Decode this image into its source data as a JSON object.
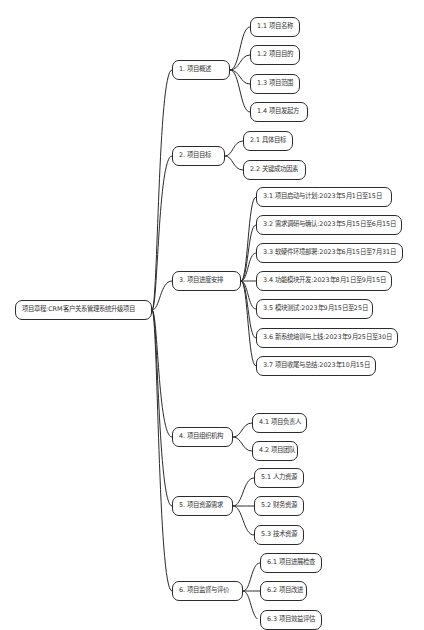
{
  "root": {
    "label": "项目章程:CRM客户关系管理系统升级项目"
  },
  "branches": [
    {
      "label": "1. 项目概述",
      "children": [
        {
          "label": "1.1 项目名称"
        },
        {
          "label": "1.2 项目目的"
        },
        {
          "label": "1.3 项目范围"
        },
        {
          "label": "1.4 项目发起方"
        }
      ]
    },
    {
      "label": "2. 项目目标",
      "children": [
        {
          "label": "2.1 具体目标"
        },
        {
          "label": "2.2 关键成功因素"
        }
      ]
    },
    {
      "label": "3. 项目进度安排",
      "children": [
        {
          "label": "3.1 项目启动与计划:2023年5月1日至15日"
        },
        {
          "label": "3.2 需求调研与确认:2023年5月15日至6月15日"
        },
        {
          "label": "3.3 软硬件环境部署:2023年6月15日至7月31日"
        },
        {
          "label": "3.4 功能模块开发:2023年8月1日至9月15日"
        },
        {
          "label": "3.5 模块测试:2023年9月15日至25日"
        },
        {
          "label": "3.6 新系统培训与上线:2023年9月25日至30日"
        },
        {
          "label": "3.7 项目收尾与总结:2023年10月15日"
        }
      ]
    },
    {
      "label": "4. 项目组织机构",
      "children": [
        {
          "label": "4.1 项目负责人"
        },
        {
          "label": "4.2 项目团队"
        }
      ]
    },
    {
      "label": "5. 项目资源需求",
      "children": [
        {
          "label": "5.1 人力资源"
        },
        {
          "label": "5.2 财务资源"
        },
        {
          "label": "5.3 技术资源"
        }
      ]
    },
    {
      "label": "6. 项目监督与评价",
      "children": [
        {
          "label": "6.1 项目进展检查"
        },
        {
          "label": "6.2 项目改进"
        },
        {
          "label": "6.3 项目效益评估"
        }
      ]
    }
  ],
  "colors": {
    "line": "#2b2b2b",
    "node_border": "#2b2b2b",
    "text": "#333333",
    "background": "#ffffff"
  }
}
